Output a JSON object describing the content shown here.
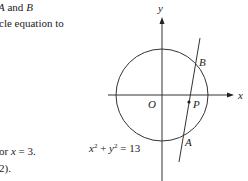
{
  "text_fragments": {
    "line1_prefix": "",
    "line1_A": "A",
    "line1_and": " and ",
    "line1_B": "B",
    "line2": "cle equation to",
    "line3_prefix": "or ",
    "line3_x": "x",
    "line3_rest": " = 3.",
    "line4": "2)."
  },
  "diagram": {
    "axis_labels": {
      "x": "x",
      "y": "y",
      "origin": "O"
    },
    "points": {
      "A": "A",
      "B": "B",
      "P": "P"
    },
    "equation": {
      "x": "x",
      "x_exp": "2",
      "plus": " + ",
      "y": "y",
      "y_exp": "2",
      "rhs": " = 13"
    }
  }
}
